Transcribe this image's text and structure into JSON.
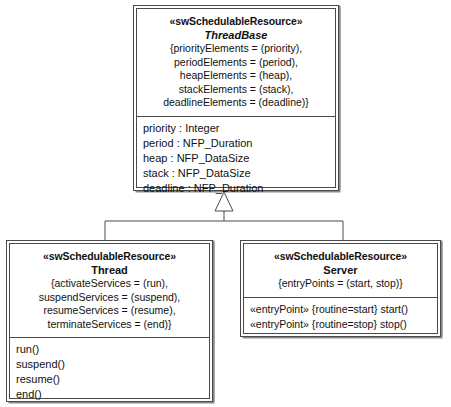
{
  "diagram": {
    "kind": "uml-class-diagram",
    "background_color": "#ffffff",
    "line_color": "#4a4a4a",
    "shadow_color": "#8a8a8a"
  },
  "classes": {
    "threadbase": {
      "stereotype": "«swSchedulableResource»",
      "name": "ThreadBase",
      "is_abstract": true,
      "tagged_values": "{priorityElements = (priority),\nperiodElements = (period),\nheapElements = (heap),\nstackElements = (stack),\ndeadlineElements = (deadline)}",
      "attributes": [
        "priority : Integer",
        "period : NFP_Duration",
        "heap : NFP_DataSize",
        "stack : NFP_DataSize",
        "deadline : NFP_Duration"
      ]
    },
    "thread": {
      "stereotype": "«swSchedulableResource»",
      "name": "Thread",
      "is_abstract": false,
      "tagged_values": "{activateServices = (run),\nsuspendServices = (suspend),\nresumeServices = (resume),\nterminateServices = (end)}",
      "operations": [
        "run()",
        "suspend()",
        "resume()",
        "end()"
      ]
    },
    "server": {
      "stereotype": "«swSchedulableResource»",
      "name": "Server",
      "is_abstract": false,
      "tagged_values": "{entryPoints = (start, stop)}",
      "operations": [
        "«entryPoint» {routine=start} start()",
        "«entryPoint» {routine=stop} stop()"
      ]
    }
  },
  "relationships": [
    {
      "type": "generalization",
      "general": "ThreadBase",
      "specific": "Thread",
      "arrow": "hollow-triangle"
    },
    {
      "type": "generalization",
      "general": "ThreadBase",
      "specific": "Server",
      "arrow": "hollow-triangle"
    }
  ]
}
